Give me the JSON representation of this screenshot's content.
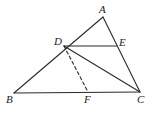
{
  "figure": {
    "background_color": "#fefefe",
    "stroke_color": "#2b2b2b",
    "label_color": "#232323",
    "width": 153,
    "height": 116,
    "points": [
      {
        "id": "A",
        "label": "A",
        "x": 103,
        "y": 17,
        "label_x": 99,
        "label_y": 4
      },
      {
        "id": "B",
        "label": "B",
        "x": 14,
        "y": 93,
        "label_x": 6,
        "label_y": 94
      },
      {
        "id": "C",
        "label": "C",
        "x": 140,
        "y": 92,
        "label_x": 137,
        "label_y": 94
      },
      {
        "id": "D",
        "label": "D",
        "x": 64,
        "y": 46,
        "label_x": 54,
        "label_y": 36
      },
      {
        "id": "E",
        "label": "E",
        "x": 117,
        "y": 46,
        "label_x": 119,
        "label_y": 37
      },
      {
        "id": "F",
        "label": "F",
        "x": 88,
        "y": 92,
        "label_x": 84,
        "label_y": 94
      }
    ],
    "segments": [
      {
        "id": "AB",
        "from": "A",
        "to": "B",
        "style": "solid"
      },
      {
        "id": "AC",
        "from": "A",
        "to": "C",
        "style": "solid"
      },
      {
        "id": "BC",
        "from": "B",
        "to": "C",
        "style": "solid"
      },
      {
        "id": "DE",
        "from": "D",
        "to": "E",
        "style": "solid"
      },
      {
        "id": "DC",
        "from": "D",
        "to": "C",
        "style": "solid"
      },
      {
        "id": "DF",
        "from": "D",
        "to": "F",
        "style": "dashed"
      }
    ]
  }
}
